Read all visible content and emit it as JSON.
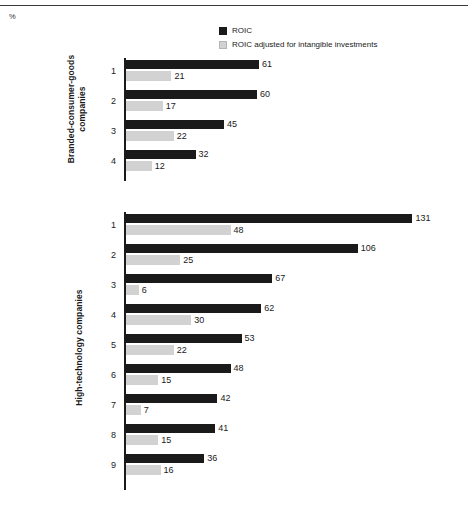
{
  "unit_label": "%",
  "legend": [
    {
      "key": "roic",
      "label": "ROIC",
      "swatch": "dark",
      "color": "#1a1a1a"
    },
    {
      "key": "roic_adjusted",
      "label": "ROIC adjusted for intangible investments",
      "swatch": "light",
      "color": "#d2d2d2"
    }
  ],
  "groups": [
    {
      "id": "branded-consumer-goods",
      "label_line1": "Branded-consumer-goods",
      "label_line2": "companies",
      "rows": [
        {
          "index": "1",
          "roic": 61,
          "roic_adjusted": 21
        },
        {
          "index": "2",
          "roic": 60,
          "roic_adjusted": 17
        },
        {
          "index": "3",
          "roic": 45,
          "roic_adjusted": 22
        },
        {
          "index": "4",
          "roic": 32,
          "roic_adjusted": 12
        }
      ]
    },
    {
      "id": "high-technology",
      "label_line1": "High-technology companies",
      "label_line2": "",
      "rows": [
        {
          "index": "1",
          "roic": 131,
          "roic_adjusted": 48
        },
        {
          "index": "2",
          "roic": 106,
          "roic_adjusted": 25
        },
        {
          "index": "3",
          "roic": 67,
          "roic_adjusted": 6
        },
        {
          "index": "4",
          "roic": 62,
          "roic_adjusted": 30
        },
        {
          "index": "5",
          "roic": 53,
          "roic_adjusted": 22
        },
        {
          "index": "6",
          "roic": 48,
          "roic_adjusted": 15
        },
        {
          "index": "7",
          "roic": 42,
          "roic_adjusted": 7
        },
        {
          "index": "8",
          "roic": 41,
          "roic_adjusted": 15
        },
        {
          "index": "9",
          "roic": 36,
          "roic_adjusted": 16
        }
      ]
    }
  ],
  "chart_data": {
    "type": "bar",
    "orientation": "horizontal",
    "title": "",
    "subtitle": "",
    "xlabel": "%",
    "ylabel": "",
    "unit": "%",
    "grid": false,
    "legend_position": "top-right",
    "xlim": [
      0,
      131
    ],
    "px_per_unit": 2.19,
    "series": [
      {
        "name": "ROIC",
        "color": "#1a1a1a"
      },
      {
        "name": "ROIC adjusted for intangible investments",
        "color": "#d2d2d2"
      }
    ],
    "panels": [
      {
        "name": "Branded-consumer-goods companies",
        "categories": [
          "1",
          "2",
          "3",
          "4"
        ],
        "series": [
          {
            "name": "ROIC",
            "values": [
              61,
              60,
              45,
              32
            ]
          },
          {
            "name": "ROIC adjusted for intangible investments",
            "values": [
              21,
              17,
              22,
              12
            ]
          }
        ]
      },
      {
        "name": "High-technology companies",
        "categories": [
          "1",
          "2",
          "3",
          "4",
          "5",
          "6",
          "7",
          "8",
          "9"
        ],
        "series": [
          {
            "name": "ROIC",
            "values": [
              131,
              106,
              67,
              62,
              53,
              48,
              42,
              41,
              36
            ]
          },
          {
            "name": "ROIC adjusted for intangible investments",
            "values": [
              48,
              25,
              6,
              30,
              22,
              15,
              7,
              15,
              16
            ]
          }
        ]
      }
    ]
  }
}
